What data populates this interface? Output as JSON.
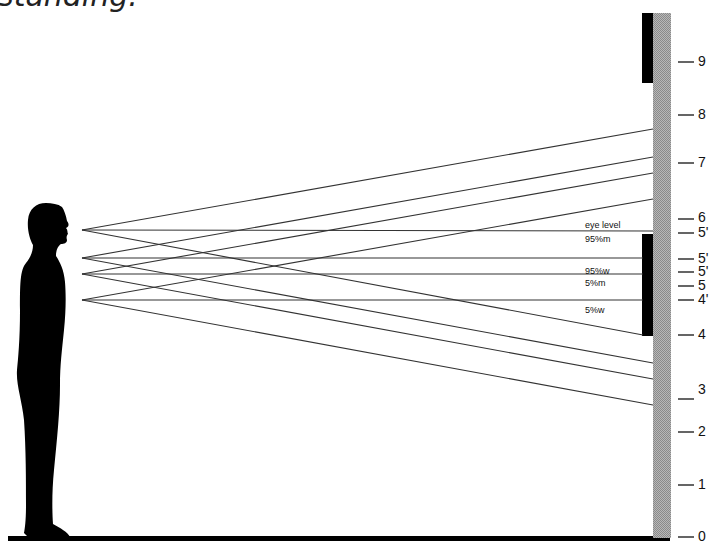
{
  "caption": "standing.",
  "wall": {
    "ticks": [
      {
        "label": "9",
        "y": 62
      },
      {
        "label": "8",
        "y": 115
      },
      {
        "label": "7",
        "y": 163
      },
      {
        "label": "6",
        "y": 218
      },
      {
        "label": "5'",
        "y": 233
      },
      {
        "label": "5'",
        "y": 259
      },
      {
        "label": "5'",
        "y": 272
      },
      {
        "label": "5",
        "y": 286
      },
      {
        "label": "4'",
        "y": 300
      },
      {
        "label": "4",
        "y": 335
      },
      {
        "label": "3",
        "y": 390
      },
      {
        "label": "2",
        "y": 432
      },
      {
        "label": "1",
        "y": 485
      },
      {
        "label": "0",
        "y": 537
      }
    ]
  },
  "sight_lines": {
    "labels": [
      {
        "text": "eye level",
        "x": 585,
        "y": 220
      },
      {
        "text": "95%m",
        "x": 585,
        "y": 234
      },
      {
        "text": "95%w",
        "x": 585,
        "y": 265
      },
      {
        "text": "5%m",
        "x": 585,
        "y": 278
      },
      {
        "text": "5%w",
        "x": 585,
        "y": 304
      }
    ]
  }
}
